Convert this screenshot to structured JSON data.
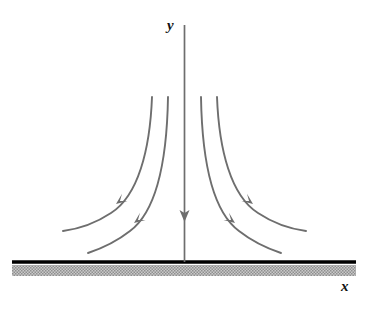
{
  "figure": {
    "title": "",
    "width": 368,
    "height": 311,
    "background_color": "#ffffff"
  },
  "labels": {
    "y_axis": "y",
    "x_axis": "x"
  },
  "colors": {
    "curve": "#6e6e6e",
    "axis": "#6e6e6e",
    "ground_line": "#000000",
    "ground_fill": "#b5b5b5",
    "label_text": "#111111",
    "background": "#ffffff"
  },
  "chart_data": {
    "type": "line",
    "title": "",
    "xlabel": "x",
    "ylabel": "y",
    "grid": false,
    "legend": null,
    "xlim": [
      0,
      368
    ],
    "ylim": [
      311,
      0
    ],
    "axes": {
      "y_axis": {
        "x": 184.5,
        "y_top": 25,
        "y_bottom": 262,
        "arrow": {
          "direction": "down",
          "tip_x": 184.5,
          "tip_y": 222,
          "half_width": 5,
          "length": 12
        }
      },
      "ground": {
        "x_start": 12,
        "x_end": 356,
        "line_y": 262,
        "line_thickness": 3.5,
        "hatch_y": 265,
        "hatch_height": 11
      }
    },
    "series": [
      {
        "name": "field-line-left-outer",
        "side": "left",
        "path": "M 152,97 C 150,150 138,196 111,213 C 96,223 78,229 63,231",
        "arrow": {
          "x": 116,
          "y": 204,
          "angle_deg": 143
        }
      },
      {
        "name": "field-line-left-inner",
        "side": "left",
        "path": "M 168,97 C 167,158 157,211 130,231 C 116,242 100,249 88,253",
        "arrow": {
          "x": 134,
          "y": 223,
          "angle_deg": 143
        }
      },
      {
        "name": "field-line-center",
        "side": "center",
        "path": "M 184.5,25 L 184.5,262",
        "arrow": {
          "x": 184.5,
          "y": 222,
          "angle_deg": 90
        }
      },
      {
        "name": "field-line-right-inner",
        "side": "right",
        "path": "M 201,97 C 202,158 212,211 239,231 C 253,242 269,249 281,253",
        "arrow": {
          "x": 235,
          "y": 223,
          "angle_deg": 37
        }
      },
      {
        "name": "field-line-right-outer",
        "side": "right",
        "path": "M 217,97 C 219,150 231,196 258,213 C 273,223 291,229 306,231",
        "arrow": {
          "x": 253,
          "y": 204,
          "angle_deg": 37
        }
      }
    ]
  }
}
